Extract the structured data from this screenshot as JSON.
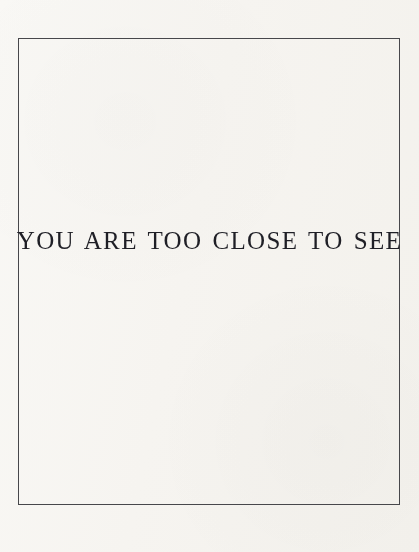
{
  "artwork": {
    "inscription": "YOU ARE TOO CLOSE TO SEE",
    "frame": {
      "border_color": "#47474b",
      "border_width_px": 1,
      "left_px": 18,
      "top_px": 38,
      "width_px": 382,
      "height_px": 467
    },
    "text_style": {
      "color": "#1f1f26",
      "font_size_px": 25,
      "letter_spacing_px": 1.35,
      "alignment": "center",
      "baseline_y_px": 250
    },
    "page": {
      "background_color": "#fbfaf8",
      "width_px": 419,
      "height_px": 552
    }
  }
}
